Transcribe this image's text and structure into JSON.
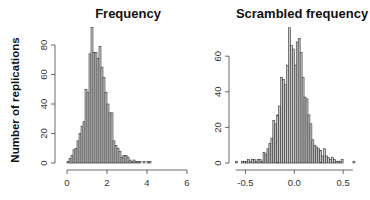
{
  "chart_data": [
    {
      "type": "bar",
      "title": "Frequency",
      "xlabel": "",
      "ylabel": "Number of replications",
      "bin_width": 0.1,
      "bin_starts": [
        0.0,
        0.1,
        0.2,
        0.3,
        0.4,
        0.5,
        0.6,
        0.7,
        0.8,
        0.9,
        1.0,
        1.1,
        1.2,
        1.3,
        1.4,
        1.5,
        1.6,
        1.7,
        1.8,
        1.9,
        2.0,
        2.1,
        2.2,
        2.3,
        2.4,
        2.5,
        2.6,
        2.7,
        2.8,
        2.9,
        3.0,
        3.1,
        3.2,
        3.3,
        3.4,
        3.5,
        3.6,
        3.7,
        3.8,
        3.9,
        4.0,
        4.1
      ],
      "values": [
        1,
        3,
        5,
        9,
        10,
        15,
        20,
        25,
        28,
        50,
        48,
        74,
        92,
        75,
        75,
        71,
        79,
        65,
        58,
        48,
        40,
        34,
        34,
        15,
        12,
        10,
        8,
        4,
        5,
        5,
        4,
        2,
        1,
        2,
        1,
        1,
        1,
        0,
        1,
        0,
        1,
        1
      ],
      "xticks": [
        "0",
        "2",
        "4",
        "6"
      ],
      "xlim": [
        0,
        6
      ],
      "yticks": [
        "0",
        "20",
        "40",
        "60",
        "80"
      ],
      "ylim": [
        0,
        92
      ],
      "grid": false,
      "legend": null
    },
    {
      "type": "bar",
      "title": "Scrambled frequency",
      "xlabel": "",
      "ylabel": "",
      "bin_width": 0.02,
      "bin_starts": [
        -0.6,
        -0.58,
        -0.56,
        -0.54,
        -0.52,
        -0.5,
        -0.48,
        -0.46,
        -0.44,
        -0.42,
        -0.4,
        -0.38,
        -0.36,
        -0.34,
        -0.32,
        -0.3,
        -0.28,
        -0.26,
        -0.24,
        -0.22,
        -0.2,
        -0.18,
        -0.16,
        -0.14,
        -0.12,
        -0.1,
        -0.08,
        -0.06,
        -0.04,
        -0.02,
        0.0,
        0.02,
        0.04,
        0.06,
        0.08,
        0.1,
        0.12,
        0.14,
        0.16,
        0.18,
        0.2,
        0.22,
        0.24,
        0.26,
        0.28,
        0.3,
        0.32,
        0.34,
        0.36,
        0.38,
        0.4,
        0.42,
        0.44,
        0.46,
        0.48,
        0.5,
        0.52,
        0.54,
        0.56,
        0.58,
        0.6
      ],
      "values": [
        1,
        0,
        0,
        1,
        1,
        1,
        2,
        1,
        2,
        2,
        1,
        2,
        2,
        1,
        6,
        5,
        8,
        11,
        14,
        24,
        22,
        27,
        32,
        48,
        47,
        44,
        55,
        76,
        66,
        64,
        55,
        68,
        70,
        62,
        48,
        37,
        36,
        27,
        22,
        13,
        10,
        9,
        8,
        7,
        4,
        8,
        4,
        3,
        2,
        3,
        2,
        1,
        1,
        1,
        2,
        0,
        0,
        0,
        0,
        0,
        1
      ],
      "xticks": [
        "-0.5",
        "0.0",
        "0.5"
      ],
      "xlim": [
        -0.6,
        0.6
      ],
      "yticks": [
        "0",
        "20",
        "40",
        "60"
      ],
      "ylim": [
        0,
        76
      ],
      "grid": false,
      "legend": null
    }
  ],
  "labels": {
    "left_title": "Frequency",
    "right_title": "Scrambled frequency",
    "ylabel": "Number of replications"
  }
}
